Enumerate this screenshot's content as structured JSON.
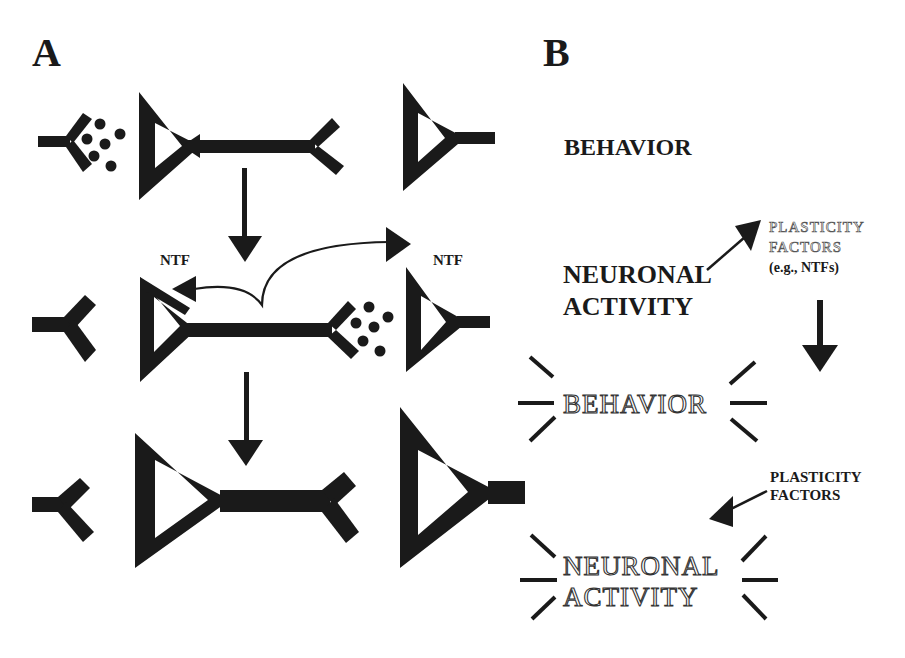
{
  "panels": {
    "a": {
      "label": "A",
      "ntf_left": "NTF",
      "ntf_right": "NTF"
    },
    "b": {
      "label": "B",
      "behavior_top": "BEHAVIOR",
      "neuronal_line1": "NEURONAL",
      "neuronal_line2": "ACTIVITY",
      "plasticity_top_line1": "PLASTICITY",
      "plasticity_top_line2": "FACTORS",
      "plasticity_top_line3": "(e.g., NTFs)",
      "behavior_glow": "BEHAVIOR",
      "plasticity_bottom_line1": "PLASTICITY",
      "plasticity_bottom_line2": "FACTORS",
      "neuronal_glow_line1": "NEURONAL",
      "neuronal_glow_line2": "ACTIVITY"
    }
  },
  "colors": {
    "ink": "#1a1a1a",
    "background": "#ffffff"
  }
}
